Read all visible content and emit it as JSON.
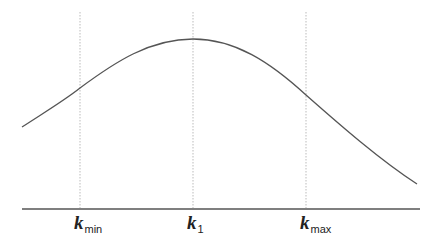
{
  "diagram": {
    "type": "curve-with-markers",
    "colors": {
      "curve": "#555555",
      "axis": "#555555",
      "guide": "#bbbbbb",
      "label": "#222222",
      "background": "#ffffff"
    },
    "axis": {
      "x1": 22,
      "x2": 420,
      "y": 209
    },
    "curve": {
      "start": [
        22,
        127
      ],
      "peak": [
        193,
        39
      ],
      "end": [
        417,
        184
      ]
    },
    "markers": [
      {
        "id": "kmin",
        "symbol": "k",
        "subscript": "min",
        "x": 80
      },
      {
        "id": "k1",
        "symbol": "k",
        "subscript": "1",
        "x": 193
      },
      {
        "id": "kmax",
        "symbol": "k",
        "subscript": "max",
        "x": 306
      }
    ],
    "guides": {
      "y_top": 12,
      "y_bottom": 208
    }
  }
}
